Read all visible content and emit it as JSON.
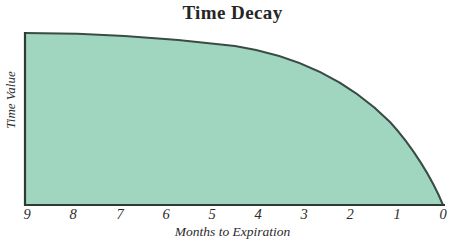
{
  "chart_data": {
    "type": "area",
    "title": "Time Decay",
    "xlabel": "Months to Expiration",
    "ylabel": "Time Value",
    "grid": false,
    "legend": "none",
    "x_axis_reversed": true,
    "xlim": [
      0,
      9
    ],
    "ylim": [
      0,
      100
    ],
    "xtick_labels": [
      "9",
      "8",
      "7",
      "6",
      "5",
      "4",
      "3",
      "2",
      "1",
      "0"
    ],
    "xticks": [
      9,
      8,
      7,
      6,
      5,
      4,
      3,
      2,
      1,
      0
    ],
    "ytick_labels": [],
    "series": [
      {
        "name": "Time Value",
        "x": [
          9,
          8,
          7,
          6,
          5,
          4,
          3,
          2,
          1,
          0.5,
          0
        ],
        "values": [
          100,
          99,
          97,
          95,
          93,
          88,
          78,
          66,
          47,
          33,
          0
        ],
        "fill_color": "#a0d6c0",
        "line_color": "#3a4a44"
      }
    ],
    "annotations": []
  },
  "figure": {
    "background_color": "#ffffff",
    "axis_color": "#2f3a36",
    "title": "Time Decay",
    "x_axis_label": "Months to Expiration",
    "y_axis_label": "Time Value"
  },
  "axis": {
    "x_ticks": [
      {
        "label": "9",
        "px": 27
      },
      {
        "label": "8",
        "px": 73
      },
      {
        "label": "7",
        "px": 120
      },
      {
        "label": "6",
        "px": 166
      },
      {
        "label": "5",
        "px": 212
      },
      {
        "label": "4",
        "px": 258
      },
      {
        "label": "3",
        "px": 304
      },
      {
        "label": "2",
        "px": 350
      },
      {
        "label": "1",
        "px": 397
      },
      {
        "label": "0",
        "px": 443
      }
    ]
  }
}
